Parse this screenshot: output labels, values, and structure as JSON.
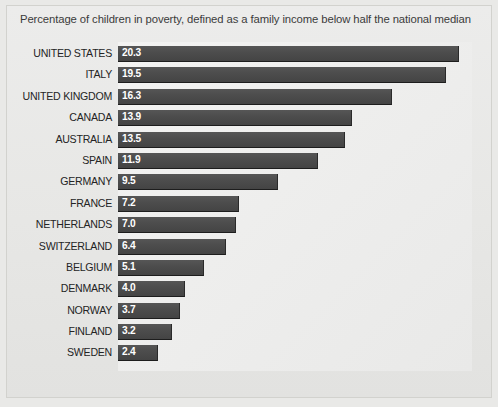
{
  "chart_data": {
    "type": "bar",
    "orientation": "horizontal",
    "title": "Percentage of children in poverty, defined as a family income below half the national median",
    "xlabel": "",
    "ylabel": "",
    "xlim": [
      0,
      20.7
    ],
    "grid": false,
    "legend": null,
    "value_label_format": "one-decimal",
    "value_label_position": "inside-left",
    "categories": [
      "UNITED STATES",
      "ITALY",
      "UNITED KINGDOM",
      "CANADA",
      "AUSTRALIA",
      "SPAIN",
      "GERMANY",
      "FRANCE",
      "NETHERLANDS",
      "SWITZERLAND",
      "BELGIUM",
      "DENMARK",
      "NORWAY",
      "FINLAND",
      "SWEDEN"
    ],
    "values": [
      20.3,
      19.5,
      16.3,
      13.9,
      13.5,
      11.9,
      9.5,
      7.2,
      7.0,
      6.4,
      5.1,
      4.0,
      3.7,
      3.2,
      2.4
    ],
    "value_labels": [
      "20.3",
      "19.5",
      "16.3",
      "13.9",
      "13.5",
      "11.9",
      "9.5",
      "7.2",
      "7.0",
      "6.4",
      "5.1",
      "4.0",
      "3.7",
      "3.2",
      "2.4"
    ],
    "colors": {
      "bar": "#4d4d4d",
      "bar_edge": "#1d1d1d",
      "value_text": "#ffffff",
      "category_text": "#242424",
      "title_text": "#3b3b3b",
      "plot_background": "#eeeeed",
      "figure_background": "#e7e7e5",
      "frame_border": "#d2d2ce"
    }
  }
}
